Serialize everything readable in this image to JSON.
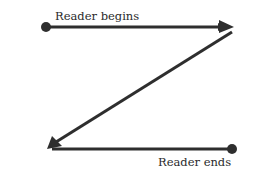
{
  "diagram": {
    "type": "z-pattern reading flow",
    "labels": {
      "start": "Reader begins",
      "end": "Reader ends"
    },
    "nodes": [
      {
        "id": "start",
        "shape": "dot"
      },
      {
        "id": "top-right",
        "shape": "arrowhead"
      },
      {
        "id": "bottom-left",
        "shape": "arrowhead"
      },
      {
        "id": "end",
        "shape": "dot"
      }
    ],
    "edges": [
      {
        "from": "start",
        "to": "top-right",
        "direction": "left-to-right"
      },
      {
        "from": "top-right",
        "to": "bottom-left",
        "direction": "diagonal"
      },
      {
        "from": "bottom-left",
        "to": "end",
        "direction": "horizontal"
      }
    ],
    "colors": {
      "stroke": "#2e2e2e",
      "background": "#ffffff"
    }
  }
}
